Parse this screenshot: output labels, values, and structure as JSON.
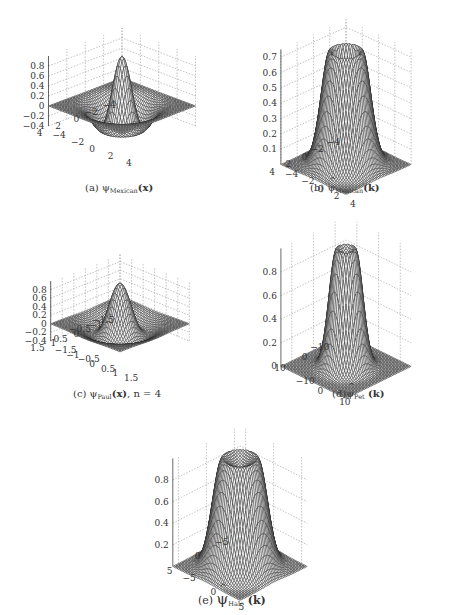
{
  "figure": {
    "captions": [
      {
        "id": "a",
        "prefix": "(a) ",
        "symbol": "ψ",
        "hat": false,
        "sub": "Mexican",
        "arg": "(x)",
        "suffix": ""
      },
      {
        "id": "b",
        "prefix": "(b) ",
        "symbol": "ψ",
        "hat": true,
        "sub": "Mexican",
        "arg": "(k)",
        "suffix": ""
      },
      {
        "id": "c",
        "prefix": "(c) ",
        "symbol": "ψ",
        "hat": false,
        "sub": "Paul",
        "arg": "(x)",
        "suffix": ", n = 4"
      },
      {
        "id": "d",
        "prefix": "(d)",
        "symbol": "ψ",
        "hat": true,
        "sub": "Pet",
        "arg": " (k)",
        "suffix": ""
      },
      {
        "id": "e",
        "prefix": "(e) ",
        "symbol": "ψ",
        "hat": true,
        "sub": "Halo",
        "arg": " (k)",
        "suffix": ""
      }
    ]
  },
  "chart_data": [
    {
      "id": "a",
      "type": "surface",
      "title": "(a) ψ_Mexican(x)",
      "function": "mexican_hat_spatial",
      "xlim": [
        -4,
        4
      ],
      "ylim": [
        -4,
        4
      ],
      "zlim": [
        -0.4,
        1.0
      ],
      "x_ticks": [
        -4,
        -2,
        0,
        2,
        4
      ],
      "y_ticks": [
        -4,
        -2,
        0,
        2,
        4
      ],
      "z_ticks": [
        -0.4,
        -0.2,
        0,
        0.2,
        0.4,
        0.6,
        0.8
      ],
      "x_tick_labels": [
        "-4",
        "-2",
        "0",
        "2",
        "4"
      ],
      "y_tick_labels": [
        "-4",
        "-2",
        "0",
        "2",
        "4"
      ],
      "z_tick_labels": [
        "-0.4",
        "-0.2",
        "0",
        "0.2",
        "0.4",
        "0.6",
        "0.8"
      ],
      "peak": 1.0,
      "min": -0.45,
      "grid": true
    },
    {
      "id": "b",
      "type": "surface",
      "title": "(b) ψ̂_Mexican(k)",
      "function": "mexican_hat_fourier",
      "xlim": [
        -4,
        4
      ],
      "ylim": [
        -4,
        4
      ],
      "zlim": [
        0,
        0.75
      ],
      "x_ticks": [
        -4,
        -2,
        0,
        2,
        4
      ],
      "y_ticks": [
        -4,
        -2,
        0,
        2,
        4
      ],
      "z_ticks": [
        0.1,
        0.2,
        0.3,
        0.4,
        0.5,
        0.6,
        0.7
      ],
      "x_tick_labels": [
        "-4",
        "-2",
        "0",
        "2",
        "4"
      ],
      "y_tick_labels": [
        "-4",
        "-2",
        "0",
        "2",
        "4"
      ],
      "z_tick_labels": [
        "0.1",
        "0.2",
        "0.3",
        "0.4",
        "0.5",
        "0.6",
        "0.7"
      ],
      "peak": 0.74,
      "grid": true
    },
    {
      "id": "c",
      "type": "surface",
      "title": "(c) ψ_Paul(x), n = 4",
      "function": "paul_spatial",
      "xlim": [
        -1.5,
        1.5
      ],
      "ylim": [
        -1.5,
        1.5
      ],
      "zlim": [
        -0.4,
        1.0
      ],
      "x_ticks": [
        -1.5,
        -1,
        -0.5,
        0,
        0.5,
        1,
        1.5
      ],
      "y_ticks": [
        -1.5,
        -1,
        -0.5,
        0,
        0.5,
        1,
        1.5
      ],
      "z_ticks": [
        -0.4,
        -0.2,
        0,
        0.2,
        0.4,
        0.6,
        0.8
      ],
      "x_tick_labels": [
        "-1.5",
        "-1",
        "-0.5",
        "0",
        "0.5",
        "1",
        "1.5"
      ],
      "y_tick_labels": [
        "-1.5",
        "-1",
        "-0.5",
        "0",
        "0.5",
        "1",
        "1.5"
      ],
      "z_tick_labels": [
        "-0.4",
        "-0.2",
        "0",
        "0.2",
        "0.4",
        "0.6",
        "0.8"
      ],
      "peak": 0.95,
      "min": -0.4,
      "n": 4,
      "grid": true
    },
    {
      "id": "d",
      "type": "surface",
      "title": "(d) ψ̂_Pet(k)",
      "function": "pet_fourier",
      "xlim": [
        -15,
        15
      ],
      "ylim": [
        -15,
        15
      ],
      "zlim": [
        0,
        1.0
      ],
      "x_ticks": [
        -10,
        0,
        10
      ],
      "y_ticks": [
        -10,
        0,
        10
      ],
      "z_ticks": [
        0,
        0.2,
        0.4,
        0.6,
        0.8
      ],
      "x_tick_labels": [
        "-10",
        "0",
        "10"
      ],
      "y_tick_labels": [
        "-10",
        "0",
        "10"
      ],
      "z_tick_labels": [
        "0",
        "0.2",
        "0.4",
        "0.6",
        "0.8"
      ],
      "peak": 1.0,
      "grid": true
    },
    {
      "id": "e",
      "type": "surface",
      "title": "(e) ψ̂_Halo(k)",
      "function": "halo_fourier",
      "xlim": [
        -6,
        6
      ],
      "ylim": [
        -6,
        6
      ],
      "zlim": [
        0,
        1.0
      ],
      "x_ticks": [
        -5,
        0,
        5
      ],
      "y_ticks": [
        -5,
        0,
        5
      ],
      "z_ticks": [
        0.2,
        0.4,
        0.6,
        0.8
      ],
      "x_tick_labels": [
        "-5",
        "0",
        "5"
      ],
      "y_tick_labels": [
        "-5",
        "0",
        "5"
      ],
      "z_tick_labels": [
        "0.2",
        "0.4",
        "0.6",
        "0.8"
      ],
      "peak": 1.0,
      "grid": true
    }
  ],
  "layout": {
    "panels": [
      {
        "id": "a",
        "x": 0,
        "y": 0,
        "w": 230,
        "h": 180,
        "ox": 122,
        "oy": 105,
        "sx": 70,
        "sy": 28,
        "sz": 70,
        "caption_x": 85,
        "caption_y": 182
      },
      {
        "id": "b",
        "x": 228,
        "y": 0,
        "w": 229,
        "h": 180,
        "ox": 118,
        "oy": 130,
        "sx": 62,
        "sy": 30,
        "sz": 115,
        "caption_x": 310,
        "caption_y": 182
      },
      {
        "id": "c",
        "x": 0,
        "y": 205,
        "w": 230,
        "h": 180,
        "ox": 120,
        "oy": 118,
        "sx": 66,
        "sy": 28,
        "sz": 60,
        "caption_x": 73,
        "caption_y": 388
      },
      {
        "id": "d",
        "x": 228,
        "y": 205,
        "w": 229,
        "h": 180,
        "ox": 118,
        "oy": 126,
        "sx": 62,
        "sy": 32,
        "sz": 118,
        "caption_x": 332,
        "caption_y": 388
      },
      {
        "id": "e",
        "x": 100,
        "y": 410,
        "w": 260,
        "h": 170,
        "ox": 140,
        "oy": 124,
        "sx": 64,
        "sy": 34,
        "sz": 108,
        "caption_x": 198,
        "caption_y": 590
      }
    ],
    "mesh_color": "#2a2a2a",
    "grid_color": "#9a9a9a"
  }
}
